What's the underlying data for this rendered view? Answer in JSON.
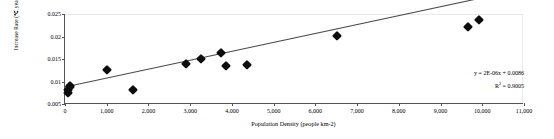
{
  "chart_data": {
    "type": "scatter",
    "title": "",
    "xlabel": "Population Density (people km-2)",
    "ylabel_prefix": "Increase Rate (",
    "ylabel_unit": "℃",
    "ylabel_suffix": " year-1)",
    "ylabel": "Increase Rate (℃ year-1)",
    "xlim": [
      0,
      11000
    ],
    "ylim": [
      0.005,
      0.025
    ],
    "xticks": [
      "0",
      "1,000",
      "2,000",
      "3,000",
      "4,000",
      "5,000",
      "6,000",
      "7,000",
      "8,000",
      "9,000",
      "10,000",
      "11,000"
    ],
    "xtick_values": [
      0,
      1000,
      2000,
      3000,
      4000,
      5000,
      6000,
      7000,
      8000,
      9000,
      10000,
      11000
    ],
    "yticks": [
      "0.005",
      "0.01",
      "0.015",
      "0.02",
      "0.025"
    ],
    "ytick_values": [
      0.005,
      0.01,
      0.015,
      0.02,
      0.025
    ],
    "grid": false,
    "legend": "none",
    "marker": "diamond",
    "marker_color": "#0d0d0d",
    "trendline_color": "#4d4d4d",
    "points": [
      {
        "x": 60,
        "y": 0.0075
      },
      {
        "x": 80,
        "y": 0.0082
      },
      {
        "x": 110,
        "y": 0.0088
      },
      {
        "x": 130,
        "y": 0.0091
      },
      {
        "x": 1000,
        "y": 0.0126
      },
      {
        "x": 1620,
        "y": 0.0081
      },
      {
        "x": 2900,
        "y": 0.014
      },
      {
        "x": 3250,
        "y": 0.0151
      },
      {
        "x": 3740,
        "y": 0.0164
      },
      {
        "x": 3860,
        "y": 0.0134
      },
      {
        "x": 4350,
        "y": 0.0137
      },
      {
        "x": 6520,
        "y": 0.0202
      },
      {
        "x": 9650,
        "y": 0.0222
      },
      {
        "x": 9930,
        "y": 0.0236
      }
    ],
    "trendline": {
      "slope": 2e-06,
      "intercept": 0.0086,
      "x_start": 0,
      "x_end": 10400
    },
    "annotation": {
      "equation": "y = 2E-06x + 0.0086",
      "r_squared_prefix": "R",
      "r_squared_exp": "2",
      "r_squared_value": " = 0.9005"
    }
  }
}
